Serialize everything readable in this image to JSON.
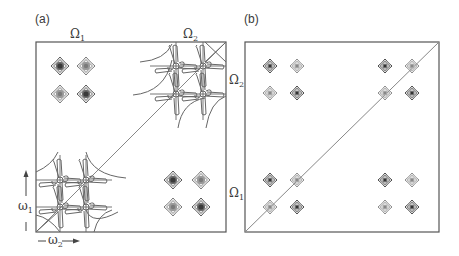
{
  "figure": {
    "panels": [
      {
        "id": "a",
        "label": "(a)",
        "top_labels": [
          "Ω",
          "Ω"
        ],
        "top_label_subs": [
          "1",
          "2"
        ],
        "axis_labels": {
          "vertical": "ω",
          "vertical_sub": "1",
          "horizontal": "ω",
          "horizontal_sub": "2"
        },
        "description": "2D spectrum with dispersive (phase-twisted) diagonal multiplets and absorptive cross-peak multiplets"
      },
      {
        "id": "b",
        "label": "(b)",
        "side_labels": [
          "Ω",
          "Ω"
        ],
        "side_label_subs": [
          "2",
          "1"
        ],
        "description": "2D spectrum with all peaks absorptive, diagonal and cross-peak multiplets"
      }
    ],
    "colors": {
      "frame": "#555555",
      "line": "#777777",
      "peak_dark": "#3c3c3c",
      "peak_light": "#8a8a8a",
      "text": "#333333"
    }
  }
}
